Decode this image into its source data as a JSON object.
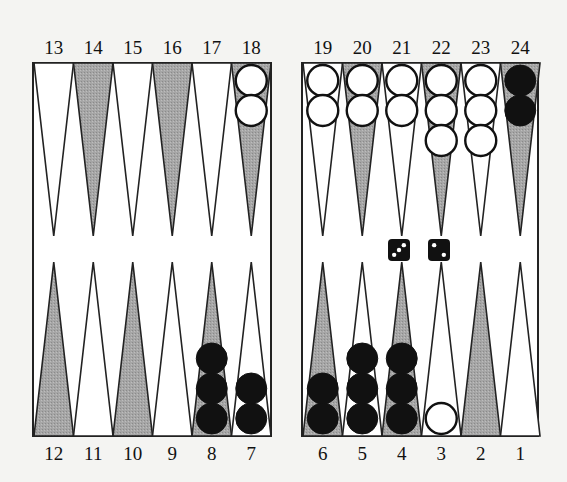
{
  "colors": {
    "background": "#f4f4f2",
    "board_fill": "#ffffff",
    "outline": "#222222",
    "dark_point": "#a8a8a8",
    "light_point": "#ffffff",
    "white_checker": "#ffffff",
    "black_checker": "#111111",
    "die_face": "#111111",
    "die_pip": "#ffffff"
  },
  "top_numbers": [
    "13",
    "14",
    "15",
    "16",
    "17",
    "18",
    "19",
    "20",
    "21",
    "22",
    "23",
    "24"
  ],
  "bottom_numbers": [
    "12",
    "11",
    "10",
    "9",
    "8",
    "7",
    "6",
    "5",
    "4",
    "3",
    "2",
    "1"
  ],
  "points": [
    {
      "point": 13,
      "shade": "light",
      "checkers": 0,
      "color": null
    },
    {
      "point": 14,
      "shade": "dark",
      "checkers": 0,
      "color": null
    },
    {
      "point": 15,
      "shade": "light",
      "checkers": 0,
      "color": null
    },
    {
      "point": 16,
      "shade": "dark",
      "checkers": 0,
      "color": null
    },
    {
      "point": 17,
      "shade": "light",
      "checkers": 0,
      "color": null
    },
    {
      "point": 18,
      "shade": "dark",
      "checkers": 2,
      "color": "white"
    },
    {
      "point": 19,
      "shade": "light",
      "checkers": 2,
      "color": "white"
    },
    {
      "point": 20,
      "shade": "dark",
      "checkers": 2,
      "color": "white"
    },
    {
      "point": 21,
      "shade": "light",
      "checkers": 2,
      "color": "white"
    },
    {
      "point": 22,
      "shade": "dark",
      "checkers": 3,
      "color": "white"
    },
    {
      "point": 23,
      "shade": "light",
      "checkers": 3,
      "color": "white"
    },
    {
      "point": 24,
      "shade": "dark",
      "checkers": 2,
      "color": "black"
    },
    {
      "point": 12,
      "shade": "dark",
      "checkers": 0,
      "color": null
    },
    {
      "point": 11,
      "shade": "light",
      "checkers": 0,
      "color": null
    },
    {
      "point": 10,
      "shade": "dark",
      "checkers": 0,
      "color": null
    },
    {
      "point": 9,
      "shade": "light",
      "checkers": 0,
      "color": null
    },
    {
      "point": 8,
      "shade": "dark",
      "checkers": 3,
      "color": "black"
    },
    {
      "point": 7,
      "shade": "light",
      "checkers": 2,
      "color": "black"
    },
    {
      "point": 6,
      "shade": "dark",
      "checkers": 2,
      "color": "black"
    },
    {
      "point": 5,
      "shade": "light",
      "checkers": 3,
      "color": "black"
    },
    {
      "point": 4,
      "shade": "dark",
      "checkers": 3,
      "color": "black"
    },
    {
      "point": 3,
      "shade": "light",
      "checkers": 1,
      "color": "white"
    },
    {
      "point": 2,
      "shade": "dark",
      "checkers": 0,
      "color": null
    },
    {
      "point": 1,
      "shade": "light",
      "checkers": 0,
      "color": null
    }
  ],
  "dice": [
    3,
    2
  ]
}
